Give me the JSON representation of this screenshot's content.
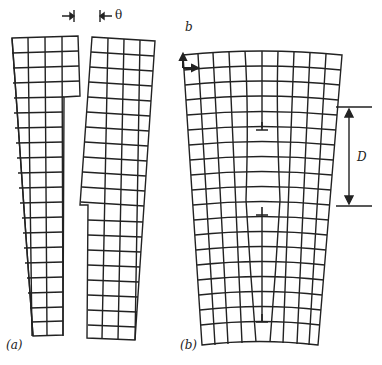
{
  "figure": {
    "panel_a": {
      "label": "(a)",
      "angle_symbol": "θ"
    },
    "panel_b": {
      "label": "(b)",
      "corner_label": "b",
      "spacing_symbol": "D",
      "dislocation_symbol": "⊥"
    }
  }
}
